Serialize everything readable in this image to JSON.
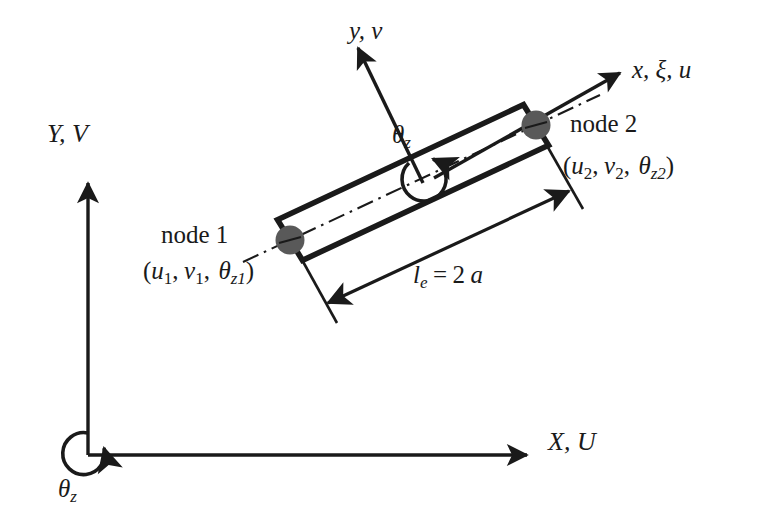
{
  "figure": {
    "kind": "engineering-diagram",
    "background_color": "#ffffff",
    "ink_color": "#1a1a1a",
    "node_marker_color": "#595959"
  },
  "global_axes": {
    "y_axis_label": "Y, V",
    "x_axis_label": "X, U",
    "origin_rotation_label_base": "θ",
    "origin_rotation_label_sub": "z"
  },
  "local_axes": {
    "x_axis_label_parts": [
      "x",
      "ξ",
      "u"
    ],
    "x_axis_label": "x,  ξ, u",
    "y_axis_label": "y, v",
    "rotation_label_base": "θ",
    "rotation_label_sub": "z"
  },
  "nodes": [
    {
      "name": "node 1",
      "dof_open": "(",
      "dof_u": "u",
      "dof_u_sub": "1",
      "dof_v": "v",
      "dof_v_sub": "1",
      "dof_theta": "θ",
      "dof_theta_sub": "z1",
      "dof_close": ")",
      "dof_label": "(u₁, v₁, θz₁)"
    },
    {
      "name": "node 2",
      "dof_open": "(",
      "dof_u": "u",
      "dof_u_sub": "2",
      "dof_v": "v",
      "dof_v_sub": "2",
      "dof_theta": "θ",
      "dof_theta_sub": "z2",
      "dof_close": ")",
      "dof_label": "(u₂, v₂, θz₂)"
    }
  ],
  "dimension": {
    "symbol": "l",
    "symbol_sub": "e",
    "equals": "=",
    "value": "2",
    "unit_symbol": "a",
    "label": "lₑ = 2 a"
  }
}
